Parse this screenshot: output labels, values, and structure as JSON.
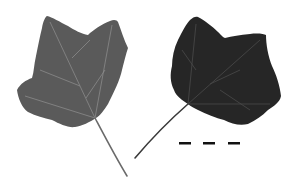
{
  "image": {
    "subject": "two tulip tree leaves",
    "background_color": "#ffffff",
    "leaves": [
      {
        "name": "left-leaf",
        "side": "underside",
        "color": "#5a5a5a",
        "vein_color": "#8a8a8a"
      },
      {
        "name": "right-leaf",
        "side": "upper surface",
        "color": "#262626",
        "vein_color": "#4a4a4a"
      }
    ],
    "scale_marks": {
      "count": 3,
      "color": "#111111"
    }
  }
}
